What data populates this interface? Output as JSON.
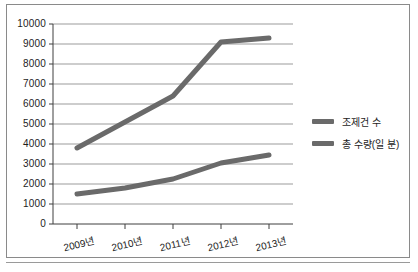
{
  "chart_data": {
    "type": "line",
    "title": "",
    "subtitle": "",
    "xlabel": "",
    "ylabel": "",
    "categories": [
      "2009년",
      "2010년",
      "2011년",
      "2012년",
      "2013년"
    ],
    "series": [
      {
        "name": "조제건 수",
        "values": [
          3800,
          5100,
          6400,
          9100,
          9300
        ],
        "color": "#6a6a6a"
      },
      {
        "name": "총 수량(일 분)",
        "values": [
          1500,
          1800,
          2250,
          3050,
          3450
        ],
        "color": "#6a6a6a"
      }
    ],
    "ylim": [
      0,
      10000
    ],
    "ytick_labels": [
      "10000",
      "9000",
      "8000",
      "7000",
      "6000",
      "5000",
      "4000",
      "3000",
      "2000",
      "1000",
      "0"
    ],
    "ytick_values": [
      10000,
      9000,
      8000,
      7000,
      6000,
      5000,
      4000,
      3000,
      2000,
      1000,
      0
    ],
    "grid": true,
    "grid_axis": "y",
    "legend_position": "right",
    "legend_entries": [
      "조제건 수",
      "총 수량(일 분)"
    ],
    "annotations": []
  },
  "axes": {
    "y": {
      "labels": [
        "10000",
        "9000",
        "8000",
        "7000",
        "6000",
        "5000",
        "4000",
        "3000",
        "2000",
        "1000",
        "0"
      ]
    },
    "x": {
      "labels": [
        "2009년",
        "2010년",
        "2011년",
        "2012년",
        "2013년"
      ]
    }
  },
  "legend": {
    "items": [
      {
        "label": "조제건 수"
      },
      {
        "label": "총 수량(일 분)"
      }
    ]
  },
  "colors": {
    "series_line": "#6a6a6a",
    "gridline": "#9b9b9b",
    "axis": "#3f3f3f",
    "frame": "#8a8a8a",
    "text": "#1d1d1d",
    "background": "#ffffff"
  }
}
